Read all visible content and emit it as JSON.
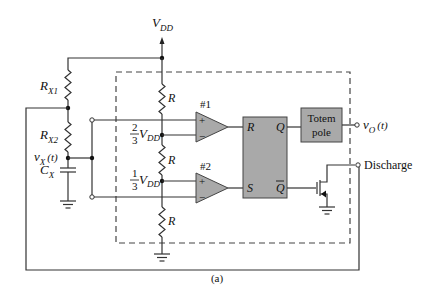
{
  "diagram": {
    "caption": "(a)",
    "supply": {
      "label": "V",
      "sub": "DD"
    },
    "external": {
      "rx1": {
        "label": "R",
        "sub": "X1"
      },
      "rx2": {
        "label": "R",
        "sub": "X2"
      },
      "cx": {
        "label": "C",
        "sub": "X"
      },
      "vx": {
        "label": "v",
        "sub": "X",
        "arg": "(t)"
      }
    },
    "divider": {
      "r_label": "R",
      "upper_node": {
        "num": "2",
        "den": "3",
        "label": "V",
        "sub": "DD"
      },
      "lower_node": {
        "num": "1",
        "den": "3",
        "label": "V",
        "sub": "DD"
      }
    },
    "comparators": [
      {
        "label": "#1",
        "plus": "+",
        "minus": "−"
      },
      {
        "label": "#2",
        "plus": "+",
        "minus": "−"
      }
    ],
    "latch": {
      "r": "R",
      "s": "S",
      "q": "Q",
      "qbar": "Q"
    },
    "totem_pole": {
      "line1": "Totem",
      "line2": "pole"
    },
    "output": {
      "label": "v",
      "sub": "O",
      "arg": "(t)"
    },
    "discharge": {
      "label": "Discharge"
    },
    "colors": {
      "block_fill": "#a9a9a9",
      "wire": "#333333",
      "background": "#ffffff"
    }
  }
}
